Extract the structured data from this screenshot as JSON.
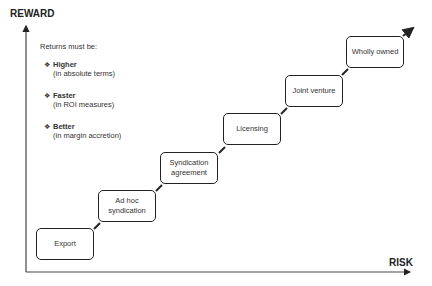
{
  "axes": {
    "y_label": "REWARD",
    "x_label": "RISK"
  },
  "notes": {
    "intro": "Returns must be:",
    "items": [
      {
        "bullet": "❖",
        "head": "Higher",
        "sub": "(in absolute terms)"
      },
      {
        "bullet": "❖",
        "head": "Faster",
        "sub": "(in ROI measures)"
      },
      {
        "bullet": "❖",
        "head": "Better",
        "sub": "(in margin accretion)"
      }
    ]
  },
  "steps": [
    {
      "label": "Export"
    },
    {
      "label": "Ad hoc syndication"
    },
    {
      "label": "Syndication agreement"
    },
    {
      "label": "Licensing"
    },
    {
      "label": "Joint venture"
    },
    {
      "label": "Wholly owned"
    }
  ]
}
